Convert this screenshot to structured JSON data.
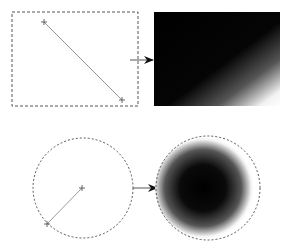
{
  "diagram": {
    "panels": [
      {
        "name": "linear-gradient",
        "source": {
          "shape": "rect",
          "x": 12,
          "y": 12,
          "width": 126,
          "height": 94,
          "drag_start": [
            44,
            22
          ],
          "drag_end": [
            122,
            100
          ]
        },
        "result": {
          "x": 154,
          "y": 12,
          "width": 126,
          "height": 94,
          "from_color": "#000000",
          "to_color": "#ffffff"
        },
        "arrow": {
          "x1": 130,
          "x2": 154,
          "y": 60
        }
      },
      {
        "name": "radial-gradient",
        "source": {
          "shape": "circle",
          "cx": 83,
          "cy": 188,
          "r": 50,
          "drag_start": [
            82,
            188
          ],
          "drag_end": [
            47,
            224
          ]
        },
        "result": {
          "cx": 208,
          "cy": 188,
          "r": 52,
          "from_color": "#000000",
          "to_color": "#ffffff"
        },
        "arrow": {
          "x1": 133,
          "x2": 157,
          "y": 188
        }
      }
    ],
    "colors": {
      "outline": "#555555",
      "line": "#999999",
      "arrow": "#111111"
    }
  }
}
